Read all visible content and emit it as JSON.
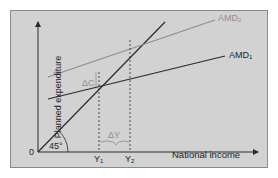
{
  "diagram": {
    "y_axis_label": "Planned expenditure",
    "x_axis_label": "National income",
    "origin_label": "0",
    "angle_label": "45°",
    "lines": [
      {
        "name": "AMD1",
        "label": "AMD",
        "subscript": "1",
        "color": "#2a2a2a"
      },
      {
        "name": "AMD2",
        "label": "AMD",
        "subscript": "2",
        "color": "#8e8e8e"
      },
      {
        "name": "45-degree line",
        "color": "#2a2a2a"
      }
    ],
    "x_ticks": [
      {
        "label": "Y",
        "subscript": "1"
      },
      {
        "label": "Y",
        "subscript": "2"
      }
    ],
    "delta_c_label": "ΔC",
    "delta_y_label": "ΔY",
    "colors": {
      "background": "#d2d2d2",
      "dark_line": "#2a2a2a",
      "gray_line": "#8e8e8e"
    }
  }
}
